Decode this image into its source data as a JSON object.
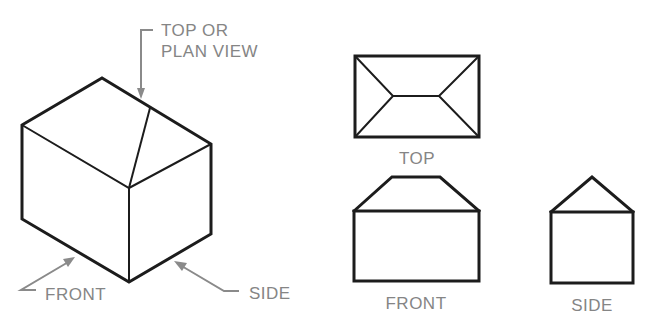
{
  "figure": {
    "type": "orthographic-projection-diagram",
    "isometric": {
      "callouts": {
        "top": {
          "line1": "TOP OR",
          "line2": "PLAN VIEW"
        },
        "front": "FRONT",
        "side": "SIDE"
      }
    },
    "views": {
      "top": {
        "label": "TOP"
      },
      "front": {
        "label": "FRONT"
      },
      "side": {
        "label": "SIDE"
      }
    },
    "colors": {
      "line": "#1c1c1c",
      "label": "#858585",
      "background": "#ffffff"
    }
  }
}
